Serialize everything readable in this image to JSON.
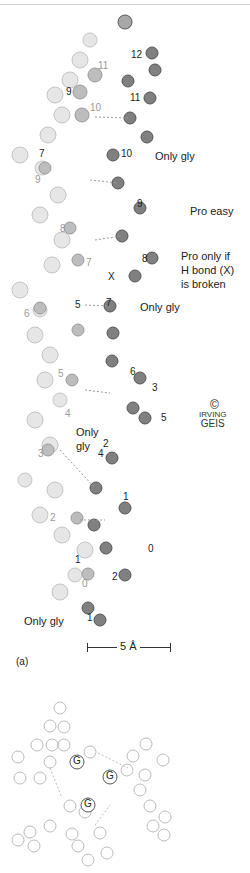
{
  "figure": {
    "panel_label": "(a)",
    "scale_bar": "5 Å",
    "copyright_symbol": "©",
    "signature_line1": "IRVING",
    "signature_line2": "GEIS"
  },
  "annotations": {
    "only_gly_10": "Only gly",
    "pro_easy": "Pro easy",
    "pro_only_if_1": "Pro only if",
    "pro_only_if_2": "H bond (X)",
    "pro_only_if_3": "is broken",
    "only_gly_7": "Only gly",
    "only_gly_4_1": "Only",
    "only_gly_4_2": "gly",
    "only_gly_1": "Only gly",
    "x_marker": "X"
  },
  "residue_labels": {
    "dark_chain": [
      "12",
      "11",
      "10",
      "9",
      "8",
      "7",
      "6",
      "5",
      "4",
      "3",
      "2",
      "1",
      "0"
    ],
    "mid_chain": [
      "11",
      "10",
      "9",
      "8",
      "7",
      "6",
      "5",
      "4",
      "3",
      "2",
      "1"
    ],
    "light_chain": [
      "9",
      "8",
      "7",
      "6",
      "5",
      "4",
      "3",
      "2",
      "1",
      "0"
    ]
  },
  "atom_labels": {
    "R": "R",
    "N": "N",
    "O": "O",
    "G": "G"
  },
  "colors": {
    "dark_atom": "#6f6f6f",
    "mid_atom": "#a9a9a9",
    "light_atom": "#dcdcdc",
    "outline": "#8a8a8a",
    "shade": "#c9c9c9"
  }
}
